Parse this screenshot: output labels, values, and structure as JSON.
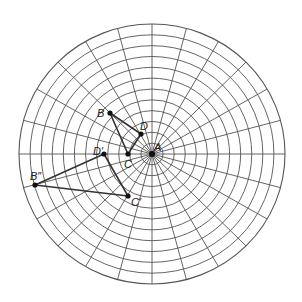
{
  "diagram": {
    "type": "polar-grid",
    "center": {
      "x": 152,
      "y": 154
    },
    "radius_x": 133,
    "radius_y": 130,
    "rings": 12,
    "spokes": 24,
    "spoke_step_deg": 15,
    "grid_color": "#555555",
    "shape_color": "#333333"
  },
  "points": [
    {
      "id": "A",
      "label": "A",
      "x": 152,
      "y": 154,
      "lx": 154,
      "ly": 151
    },
    {
      "id": "B",
      "label": "B",
      "x": 110,
      "y": 113,
      "lx": 97,
      "ly": 117
    },
    {
      "id": "D",
      "label": "D",
      "x": 141,
      "y": 134,
      "lx": 140,
      "ly": 130
    },
    {
      "id": "C",
      "label": "C",
      "x": 128,
      "y": 154,
      "lx": 124,
      "ly": 168
    },
    {
      "id": "D1",
      "label": "D′",
      "x": 104,
      "y": 154,
      "lx": 93,
      "ly": 155
    },
    {
      "id": "B2",
      "label": "B″",
      "x": 35,
      "y": 185,
      "lx": 30,
      "ly": 180
    },
    {
      "id": "C1",
      "label": "C′",
      "x": 128,
      "y": 196,
      "lx": 131,
      "ly": 206
    }
  ],
  "triangles": [
    {
      "name": "triangle-BCD",
      "vertices": [
        "B",
        "C",
        "D"
      ]
    },
    {
      "name": "triangle-D'B''C'",
      "vertices": [
        "D1",
        "B2",
        "C1"
      ]
    }
  ]
}
